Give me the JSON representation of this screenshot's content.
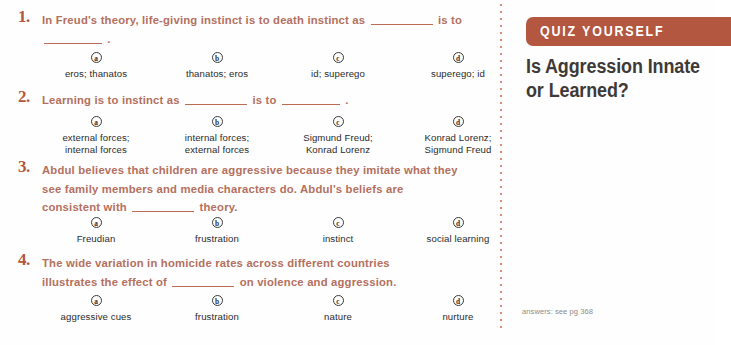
{
  "page": {
    "background_color": "#fefefe",
    "question_text_color": "#b4705f",
    "number_color": "#b2573f",
    "banner_color": "#b35740",
    "divider_color": "#d98c76",
    "option_text_color": "#2b2b2b"
  },
  "sidebar": {
    "banner_label": "QUIZ YOURSELF",
    "heading": "Is Aggression Innate or Learned?",
    "answers_note": "answers: see pg 368"
  },
  "questions": [
    {
      "number": "1.",
      "text_parts": [
        "In Freud's theory, life-giving instinct is to death instinct as ",
        " is to ",
        " ."
      ],
      "options": [
        {
          "letter": "a",
          "label": "eros; thanatos"
        },
        {
          "letter": "b",
          "label": "thanatos; eros"
        },
        {
          "letter": "c",
          "label": "id; superego"
        },
        {
          "letter": "d",
          "label": "superego; id"
        }
      ]
    },
    {
      "number": "2.",
      "text_parts": [
        "Learning is to instinct as ",
        " is to ",
        " ."
      ],
      "options": [
        {
          "letter": "a",
          "label": "external forces;\ninternal forces"
        },
        {
          "letter": "b",
          "label": "internal forces;\nexternal forces"
        },
        {
          "letter": "c",
          "label": "Sigmund Freud;\nKonrad Lorenz"
        },
        {
          "letter": "d",
          "label": "Konrad Lorenz;\nSigmund Freud"
        }
      ]
    },
    {
      "number": "3.",
      "text_parts": [
        "Abdul believes that children are aggressive because they imitate what they see family members and media characters do. Abdul's beliefs are consistent with ",
        " theory."
      ],
      "options": [
        {
          "letter": "a",
          "label": "Freudian"
        },
        {
          "letter": "b",
          "label": "frustration"
        },
        {
          "letter": "c",
          "label": "instinct"
        },
        {
          "letter": "d",
          "label": "social learning"
        }
      ]
    },
    {
      "number": "4.",
      "text_parts": [
        "The wide variation in homicide rates across different countries illustrates the effect of ",
        " on violence and aggression."
      ],
      "options": [
        {
          "letter": "a",
          "label": "aggressive cues"
        },
        {
          "letter": "b",
          "label": "frustration"
        },
        {
          "letter": "c",
          "label": "nature"
        },
        {
          "letter": "d",
          "label": "nurture"
        }
      ]
    }
  ]
}
